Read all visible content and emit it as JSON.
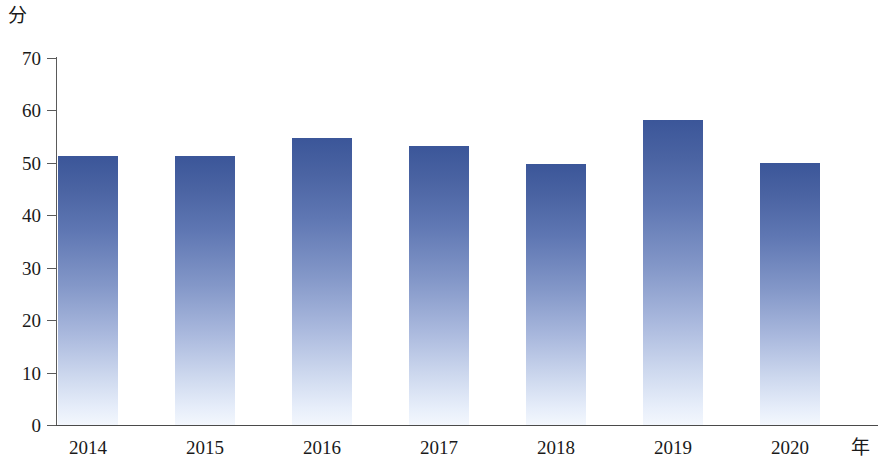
{
  "chart_data": {
    "type": "bar",
    "title": "",
    "subtitle": "",
    "xlabel": "年",
    "ylabel": "分",
    "categories": [
      "2014",
      "2015",
      "2016",
      "2017",
      "2018",
      "2019",
      "2020"
    ],
    "values": [
      51.3,
      51.4,
      54.7,
      53.2,
      49.8,
      58.2,
      50.0
    ],
    "series": [
      {
        "name": "",
        "values": [
          51.3,
          51.4,
          54.7,
          53.2,
          49.8,
          58.2,
          50.0
        ]
      }
    ],
    "ylim": [
      0,
      70
    ],
    "yticks": [
      0,
      10,
      20,
      30,
      40,
      50,
      60,
      70
    ],
    "ytick_labels": [
      "0",
      "10",
      "20",
      "30",
      "40",
      "50",
      "60",
      "70"
    ],
    "grid": false,
    "legend": false,
    "legend_position": "none",
    "bar_color_top": "#3b5699",
    "bar_color_bottom": "#f3f7fd",
    "axis_color": "#4a4a4a",
    "background": "#ffffff"
  }
}
